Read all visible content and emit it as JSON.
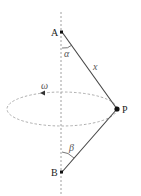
{
  "diagram": {
    "type": "physics-rotating-string",
    "points": {
      "A": {
        "label": "A"
      },
      "B": {
        "label": "B"
      },
      "P": {
        "label": "P"
      }
    },
    "labels": {
      "alpha": "α",
      "beta": "β",
      "x": "x",
      "omega": "ω"
    },
    "colors": {
      "line": "#444444",
      "dashed": "#888888",
      "point": "#111111"
    }
  }
}
